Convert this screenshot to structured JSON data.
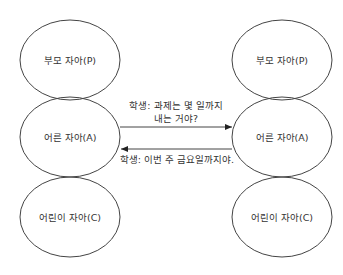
{
  "diagram": {
    "left": {
      "parent": "부모 자아(P)",
      "adult": "어른 자아(A)",
      "child": "어린이 자아(C)"
    },
    "right": {
      "parent": "부모 자아(P)",
      "adult": "어른 자아(A)",
      "child": "어린이 자아(C)"
    },
    "messages": {
      "forward_line1": "학생: 과제는 몇 일까지",
      "forward_line2": "내는 거야?",
      "reply": "학생: 이번 주 금요일까지야."
    }
  }
}
